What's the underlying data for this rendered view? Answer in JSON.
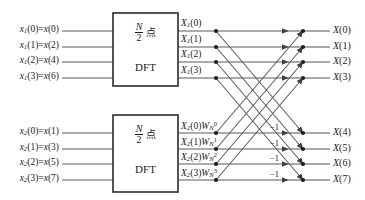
{
  "diagram": {
    "line_color": "#4a4a4a",
    "text_color": "#1a1a1a",
    "box_border_color": "#2b2b2b"
  },
  "blocks": [
    {
      "name": "upper-dft-block",
      "fraction_num": "N",
      "fraction_den": "2",
      "unit": "点",
      "label": "DFT"
    },
    {
      "name": "lower-dft-block",
      "fraction_num": "N",
      "fraction_den": "2",
      "unit": "点",
      "label": "DFT"
    }
  ],
  "inputs": {
    "upper": [
      {
        "sym": "x",
        "sub": "1",
        "idx": "0",
        "eq": "x(0)"
      },
      {
        "sym": "x",
        "sub": "1",
        "idx": "1",
        "eq": "x(2)"
      },
      {
        "sym": "x",
        "sub": "1",
        "idx": "2",
        "eq": "x(4)"
      },
      {
        "sym": "x",
        "sub": "1",
        "idx": "3",
        "eq": "x(6)"
      }
    ],
    "lower": [
      {
        "sym": "x",
        "sub": "2",
        "idx": "0",
        "eq": "x(1)"
      },
      {
        "sym": "x",
        "sub": "2",
        "idx": "1",
        "eq": "x(3)"
      },
      {
        "sym": "x",
        "sub": "2",
        "idx": "2",
        "eq": "x(5)"
      },
      {
        "sym": "x",
        "sub": "2",
        "idx": "3",
        "eq": "x(7)"
      }
    ]
  },
  "midlabels": {
    "upper": [
      {
        "sym": "X",
        "sub": "1",
        "idx": "0"
      },
      {
        "sym": "X",
        "sub": "1",
        "idx": "1"
      },
      {
        "sym": "X",
        "sub": "1",
        "idx": "2"
      },
      {
        "sym": "X",
        "sub": "1",
        "idx": "3"
      }
    ],
    "lower": [
      {
        "sym": "X",
        "sub": "2",
        "idx": "0",
        "w": "W",
        "wsub": "N",
        "wsup": "0"
      },
      {
        "sym": "X",
        "sub": "2",
        "idx": "1",
        "w": "W",
        "wsub": "N",
        "wsup": "1"
      },
      {
        "sym": "X",
        "sub": "2",
        "idx": "2",
        "w": "W",
        "wsub": "N",
        "wsup": "2"
      },
      {
        "sym": "X",
        "sub": "2",
        "idx": "3",
        "w": "W",
        "wsub": "N",
        "wsup": "3"
      }
    ]
  },
  "outputs": [
    {
      "text": "X(0)"
    },
    {
      "text": "X(1)"
    },
    {
      "text": "X(2)"
    },
    {
      "text": "X(3)"
    },
    {
      "text": "X(4)"
    },
    {
      "text": "X(5)"
    },
    {
      "text": "X(6)"
    },
    {
      "text": "X(7)"
    }
  ],
  "minus_ones": [
    {
      "text": "−1"
    },
    {
      "text": "−1"
    },
    {
      "text": "−1"
    },
    {
      "text": "−1"
    }
  ],
  "geometry": {
    "rows_y": [
      31,
      47,
      62,
      78,
      133,
      149,
      164,
      180
    ],
    "box_x0": 113,
    "box_x1": 178,
    "upper_box_y0": 13,
    "upper_box_y1": 86,
    "lower_box_y0": 115,
    "lower_box_y1": 192,
    "input_line_x0": 62,
    "branch_x": 216,
    "arrow_x": 288,
    "sum_x": 303,
    "out_line_x1": 330
  }
}
